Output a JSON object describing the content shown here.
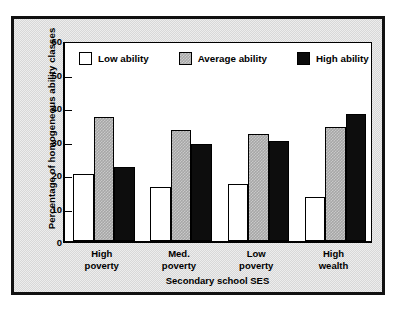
{
  "chart_data": {
    "type": "bar",
    "title": "",
    "subtitle": "",
    "xlabel": "Secondary school SES",
    "ylabel": "Percentage of homogeneous ability classes",
    "categories": [
      "High\npoverty",
      "Med.\npoverty",
      "Low\npoverty",
      "High\nwealth"
    ],
    "series": [
      {
        "name": "Low ability",
        "color": "#ffffff",
        "values": [
          20,
          16,
          17,
          13
        ]
      },
      {
        "name": "Average ability",
        "color": "#a6a6a6",
        "values": [
          37,
          33,
          32,
          34
        ]
      },
      {
        "name": "High ability",
        "color": "#0d0d0d",
        "values": [
          22,
          29,
          30,
          38
        ]
      }
    ],
    "ylim": [
      0,
      60
    ],
    "yticks": [
      0,
      10,
      20,
      30,
      40,
      50,
      60
    ],
    "ytick_labels": [
      "0",
      "10",
      "20",
      "30",
      "40",
      "50",
      "60"
    ],
    "grid": false,
    "legend_position": "top-inside"
  },
  "legend": {
    "entries": [
      {
        "label": "Low ability",
        "swatch": "legend-swatch-white"
      },
      {
        "label": "Average ability",
        "swatch": "legend-swatch-gray"
      },
      {
        "label": "High ability",
        "swatch": "legend-swatch-black"
      }
    ]
  },
  "axes": {
    "y_title": "Percentage of homogeneous ability classes",
    "x_title": "Secondary school SES",
    "y_labels": [
      "60",
      "50",
      "40",
      "30",
      "20",
      "10",
      "0"
    ],
    "x_labels": [
      "High\npoverty",
      "Med.\npoverty",
      "Low\npoverty",
      "High\nwealth"
    ]
  },
  "colors": {
    "frame": "#111111",
    "page_background": "#d8d8d8",
    "plot_background": "#ffffff",
    "low_ability": "#ffffff",
    "average_ability": "#a6a6a6",
    "high_ability": "#0d0d0d"
  }
}
